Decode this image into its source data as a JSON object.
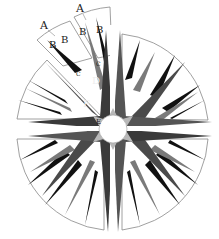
{
  "diagram": {
    "center": {
      "x": 113,
      "y": 129
    },
    "outer_radius": 100,
    "inner_radius": 14,
    "colors": {
      "background": "#ffffff",
      "outline": "#888888",
      "black_point": "#111111",
      "dark_point": "#4a4a4a",
      "mid_point": "#7a7a7a",
      "light_fill": "#b8b8b8"
    },
    "labels": [
      {
        "id": "A1",
        "text": "A",
        "x": 44,
        "y": 28,
        "size": 11
      },
      {
        "id": "A2",
        "text": "A",
        "x": 79,
        "y": 12,
        "size": 11
      },
      {
        "id": "B1",
        "text": "B",
        "x": 52,
        "y": 45,
        "size": 10
      },
      {
        "id": "B2",
        "text": "B",
        "x": 63,
        "y": 41,
        "size": 10
      },
      {
        "id": "B3",
        "text": "B",
        "x": 83,
        "y": 32,
        "size": 10
      },
      {
        "id": "B4",
        "text": "B",
        "x": 98,
        "y": 30,
        "size": 10
      },
      {
        "id": "C1",
        "text": "C",
        "x": 78,
        "y": 75,
        "size": 6
      },
      {
        "id": "C2",
        "text": "C",
        "x": 96,
        "y": 64,
        "size": 6
      },
      {
        "id": "D",
        "text": "D",
        "x": 93,
        "y": 83,
        "size": 10
      },
      {
        "id": "F",
        "text": "F",
        "x": 83,
        "y": 106,
        "size": 10
      },
      {
        "id": "E",
        "text": "E",
        "x": 97,
        "y": 123,
        "size": 7
      }
    ]
  }
}
